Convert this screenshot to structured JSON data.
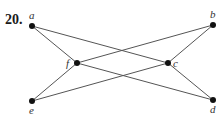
{
  "exercise_number": "20.",
  "graph": {
    "nodes": [
      {
        "id": "a",
        "label": "a",
        "x": 32,
        "y": 26,
        "lx": 29,
        "ly": 19
      },
      {
        "id": "b",
        "label": "b",
        "x": 213,
        "y": 25,
        "lx": 210,
        "ly": 18
      },
      {
        "id": "f",
        "label": "f",
        "x": 77,
        "y": 63,
        "lx": 66,
        "ly": 67
      },
      {
        "id": "c",
        "label": "c",
        "x": 168,
        "y": 63,
        "lx": 173,
        "ly": 67
      },
      {
        "id": "e",
        "label": "e",
        "x": 32,
        "y": 101,
        "lx": 29,
        "ly": 114
      },
      {
        "id": "d",
        "label": "d",
        "x": 213,
        "y": 100,
        "lx": 210,
        "ly": 113
      }
    ],
    "edges": [
      [
        "a",
        "f"
      ],
      [
        "a",
        "c"
      ],
      [
        "e",
        "f"
      ],
      [
        "e",
        "c"
      ],
      [
        "f",
        "b"
      ],
      [
        "f",
        "d"
      ],
      [
        "b",
        "c"
      ],
      [
        "c",
        "d"
      ]
    ]
  },
  "colors": {
    "line": "#555555",
    "node": "#111111"
  }
}
